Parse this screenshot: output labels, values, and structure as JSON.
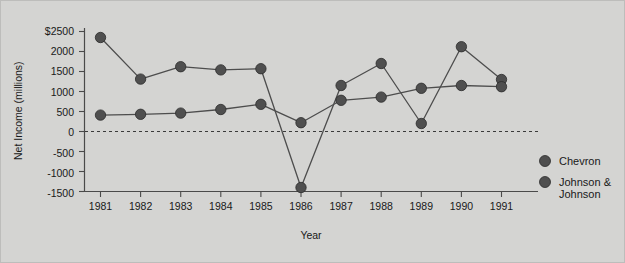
{
  "figure": {
    "background_color": "#d4d4d2",
    "ink_color": "#4f4f4f"
  },
  "chart_data": {
    "type": "line",
    "title": "",
    "xlabel": "Year",
    "ylabel": "Net Income (millions)",
    "categories": [
      "1981",
      "1982",
      "1983",
      "1984",
      "1985",
      "1986",
      "1987",
      "1988",
      "1989",
      "1990",
      "1991"
    ],
    "x": [
      1981,
      1982,
      1983,
      1984,
      1985,
      1986,
      1987,
      1988,
      1989,
      1990,
      1991
    ],
    "xlim": [
      1980.6,
      1991.4
    ],
    "ylim": [
      -1500,
      2500
    ],
    "yticks": [
      -1500,
      -1000,
      -500,
      0,
      500,
      1000,
      1500,
      2000,
      2500
    ],
    "ytick_labels": [
      "-1500",
      "-1000",
      "-500",
      "0",
      "500",
      "1000",
      "1500",
      "2000",
      "$2500"
    ],
    "grid": false,
    "zero_reference_line": 0,
    "legend_position": "right",
    "series": [
      {
        "name": "Chevron",
        "color": "#4f4f4f",
        "marker": "circle",
        "values": [
          2350,
          1310,
          1620,
          1540,
          1570,
          -1400,
          1150,
          1700,
          200,
          2120,
          1300
        ]
      },
      {
        "name": "Johnson & Johnson",
        "color": "#4f4f4f",
        "marker": "circle",
        "values": [
          410,
          430,
          460,
          550,
          680,
          220,
          780,
          860,
          1080,
          1150,
          1120
        ]
      }
    ]
  },
  "legend": {
    "entries": [
      {
        "label": "Chevron"
      },
      {
        "label_line1": "Johnson &",
        "label_line2": "Johnson"
      }
    ]
  }
}
